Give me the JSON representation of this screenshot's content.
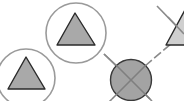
{
  "diagram": {
    "background": "#ffffff",
    "colors": {
      "ring_stroke": "#9a9a9a",
      "triangle_fill": "#a9a9a9",
      "triangle_stroke": "#2a2a2a",
      "blocked_fill": "#a3a3a3",
      "blocked_stroke": "#3a3a3a",
      "line_stroke": "#8a8a8a",
      "partial_triangle_fill": "#cfcfcf"
    },
    "nodes": [
      {
        "id": "triangle-ring-1",
        "shape": "triangle-in-circle"
      },
      {
        "id": "triangle-ring-2",
        "shape": "triangle-in-circle"
      },
      {
        "id": "blocked-node",
        "shape": "crossed-filled-circle"
      },
      {
        "id": "partial-triangle",
        "shape": "triangle-partial"
      }
    ]
  }
}
